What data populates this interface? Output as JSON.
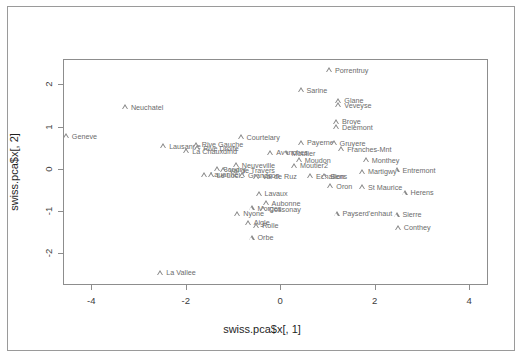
{
  "chart_data": {
    "type": "scatter",
    "title": "",
    "xlabel": "swiss.pca$x[, 1]",
    "ylabel": "swiss.pca$x[, 2]",
    "xlim": [
      -4.6,
      4.4
    ],
    "ylim": [
      -2.75,
      2.6
    ],
    "xticks": [
      -4,
      -2,
      0,
      2,
      4
    ],
    "yticks": [
      2,
      1,
      0,
      -1,
      -2
    ],
    "xticklabels": [
      "-4",
      "-2",
      "0",
      "2",
      "4"
    ],
    "yticklabels": [
      "2",
      "1",
      "0",
      "-1",
      "-2"
    ],
    "grid": false,
    "legend": null,
    "marker": "open-triangle",
    "marker_color": "#8a8a8a",
    "label_color": "#6b6b6b",
    "points": [
      {
        "label": "Porrentruy",
        "x": 1.02,
        "y": 2.35
      },
      {
        "label": "Sarine",
        "x": 0.42,
        "y": 1.87
      },
      {
        "label": "Glane",
        "x": 1.22,
        "y": 1.62
      },
      {
        "label": "Veveyse",
        "x": 1.22,
        "y": 1.52
      },
      {
        "label": "Neuchatel",
        "x": -3.3,
        "y": 1.47
      },
      {
        "label": "Broye",
        "x": 1.17,
        "y": 1.13
      },
      {
        "label": "Delemont",
        "x": 1.17,
        "y": 1.0
      },
      {
        "label": "Geneve",
        "x": -4.55,
        "y": 0.78
      },
      {
        "label": "Courtelary",
        "x": -0.85,
        "y": 0.76
      },
      {
        "label": "Payerne",
        "x": 0.43,
        "y": 0.63
      },
      {
        "label": "Gruyere",
        "x": 1.12,
        "y": 0.62
      },
      {
        "label": "Lausanne",
        "x": -2.49,
        "y": 0.55
      },
      {
        "label": "Rive Gauche",
        "x": -1.8,
        "y": 0.58
      },
      {
        "label": "Rive Droite",
        "x": -1.77,
        "y": 0.5
      },
      {
        "label": "La Chauxdfnd",
        "x": -2.0,
        "y": 0.43
      },
      {
        "label": "Franches-Mnt",
        "x": 1.28,
        "y": 0.48
      },
      {
        "label": "Avenches",
        "x": -0.22,
        "y": 0.4
      },
      {
        "label": "Moutier",
        "x": 0.1,
        "y": 0.38
      },
      {
        "label": "Monthey",
        "x": 1.8,
        "y": 0.22
      },
      {
        "label": "Moudon",
        "x": 0.38,
        "y": 0.22
      },
      {
        "label": "Neuveville",
        "x": -0.95,
        "y": 0.1
      },
      {
        "label": "Moutier2",
        "x": 0.28,
        "y": 0.08
      },
      {
        "label": "Boudry",
        "x": -1.35,
        "y": 0.0
      },
      {
        "label": "Val de Travers",
        "x": -1.22,
        "y": -0.02
      },
      {
        "label": "Entremont",
        "x": 2.45,
        "y": -0.02
      },
      {
        "label": "Martigwy",
        "x": 1.72,
        "y": -0.06
      },
      {
        "label": "Lauanne",
        "x": -1.62,
        "y": -0.12
      },
      {
        "label": "Le Locle",
        "x": -1.48,
        "y": -0.14
      },
      {
        "label": "Grandson",
        "x": -0.82,
        "y": -0.14
      },
      {
        "label": "Val de Ruz",
        "x": -0.52,
        "y": -0.17
      },
      {
        "label": "Echallens",
        "x": 0.62,
        "y": -0.16
      },
      {
        "label": "Sion",
        "x": 0.92,
        "y": -0.16
      },
      {
        "label": "Oron",
        "x": 1.05,
        "y": -0.4
      },
      {
        "label": "St Maurice",
        "x": 1.72,
        "y": -0.42
      },
      {
        "label": "Herens",
        "x": 2.62,
        "y": -0.55
      },
      {
        "label": "Lavaux",
        "x": -0.47,
        "y": -0.57
      },
      {
        "label": "Aubonne",
        "x": -0.32,
        "y": -0.8
      },
      {
        "label": "Morges",
        "x": -0.62,
        "y": -0.92
      },
      {
        "label": "Cossonay",
        "x": -0.38,
        "y": -0.94
      },
      {
        "label": "Nyone",
        "x": -0.92,
        "y": -1.05
      },
      {
        "label": "Payserd'enhaut",
        "x": 1.18,
        "y": -1.05
      },
      {
        "label": "Sierre",
        "x": 2.45,
        "y": -1.08
      },
      {
        "label": "Aigle",
        "x": -0.7,
        "y": -1.27
      },
      {
        "label": "Rolle",
        "x": -0.52,
        "y": -1.33
      },
      {
        "label": "Conthey",
        "x": 2.48,
        "y": -1.38
      },
      {
        "label": "Orbe",
        "x": -0.62,
        "y": -1.62
      },
      {
        "label": "La Vallee",
        "x": -2.55,
        "y": -2.45
      }
    ]
  }
}
